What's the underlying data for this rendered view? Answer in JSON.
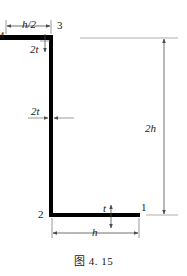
{
  "figure": {
    "caption": "图 4. 15",
    "background_color": "#ffffff",
    "stroke_color": "#000000",
    "thin_stroke_color": "#808080",
    "text_color": "#1a1a1a"
  },
  "section": {
    "shape": "z-section",
    "top_flange": {
      "label": "h/2",
      "thickness_label": "2t"
    },
    "web": {
      "label": "2h",
      "thickness_label": "2t"
    },
    "bottom_flange": {
      "label": "h",
      "thickness_label": "t"
    }
  },
  "node_labels": {
    "node_4": "4",
    "node_3": "3",
    "node_2": "2",
    "node_1": "1"
  },
  "dimensions": [
    {
      "name": "top-flange-width",
      "label": "h/2",
      "orientation": "horizontal",
      "position": "top"
    },
    {
      "name": "top-flange-thickness",
      "label": "2t",
      "orientation": "vertical",
      "position": "upper-left"
    },
    {
      "name": "web-thickness",
      "label": "2t",
      "orientation": "horizontal",
      "position": "middle-left"
    },
    {
      "name": "overall-height",
      "label": "2h",
      "orientation": "vertical",
      "position": "right"
    },
    {
      "name": "bottom-flange-thickness",
      "label": "t",
      "orientation": "vertical",
      "position": "bottom-middle"
    },
    {
      "name": "bottom-flange-width",
      "label": "h",
      "orientation": "horizontal",
      "position": "bottom"
    }
  ]
}
